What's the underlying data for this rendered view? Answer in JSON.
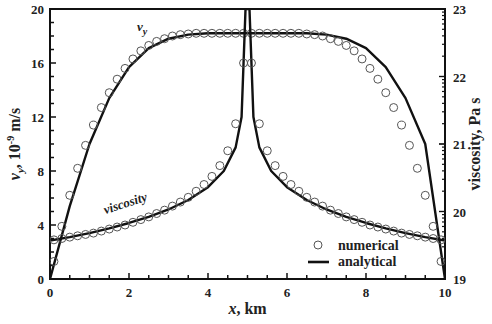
{
  "chart_data": {
    "type": "line",
    "title": "",
    "xlabel": "x, km",
    "ylabel_left": "v_y, 10^-9 m/s",
    "ylabel_right": "viscosity, Pa s",
    "xlim": [
      0,
      10
    ],
    "ylim_left": [
      0,
      20
    ],
    "ylim_right": [
      19,
      23
    ],
    "right_axis_scale": "log10 (exponent labels)",
    "x_ticks": [
      "0",
      "2",
      "4",
      "6",
      "8",
      "10"
    ],
    "y_left_ticks": [
      "0",
      "4",
      "8",
      "12",
      "16",
      "20"
    ],
    "y_right_ticks": [
      "19",
      "20",
      "21",
      "22",
      "23"
    ],
    "grid": false,
    "legend": {
      "position": "lower right",
      "entries": [
        {
          "label": "numerical",
          "marker": "open-circle"
        },
        {
          "label": "analytical",
          "marker": "solid-line"
        }
      ]
    },
    "annotations": [
      {
        "text": "v_y",
        "x": 2.2,
        "y": 18.4
      },
      {
        "text": "viscosity",
        "x": 1.4,
        "y": 4.8
      }
    ],
    "series": [
      {
        "name": "v_y (analytical)",
        "axis": "left",
        "style": "line",
        "x": [
          0,
          0.5,
          1,
          1.5,
          2,
          2.5,
          3,
          3.5,
          4,
          4.5,
          5,
          5.5,
          6,
          6.5,
          7,
          7.5,
          8,
          8.5,
          9,
          9.5,
          10
        ],
        "values": [
          0,
          5.4,
          10.0,
          13.4,
          15.7,
          17.1,
          17.8,
          18.1,
          18.2,
          18.2,
          18.2,
          18.2,
          18.2,
          18.2,
          18.1,
          17.8,
          17.1,
          15.7,
          13.4,
          10.0,
          0
        ]
      },
      {
        "name": "v_y (numerical)",
        "axis": "left",
        "style": "circles",
        "x": [
          0.1,
          0.3,
          0.5,
          0.7,
          0.9,
          1.1,
          1.3,
          1.5,
          1.7,
          1.9,
          2.1,
          2.3,
          2.5,
          2.7,
          2.9,
          3.1,
          3.3,
          3.5,
          3.7,
          3.9,
          4.1,
          4.3,
          4.5,
          4.7,
          4.9,
          5.1,
          5.3,
          5.5,
          5.7,
          5.9,
          6.1,
          6.3,
          6.5,
          6.7,
          6.9,
          7.1,
          7.3,
          7.5,
          7.7,
          7.9,
          8.1,
          8.3,
          8.5,
          8.7,
          8.9,
          9.1,
          9.3,
          9.5,
          9.7,
          9.9
        ],
        "values": [
          1.3,
          3.9,
          6.2,
          8.2,
          9.9,
          11.4,
          12.7,
          13.8,
          14.8,
          15.6,
          16.3,
          16.9,
          17.3,
          17.6,
          17.8,
          18.0,
          18.1,
          18.15,
          18.2,
          18.2,
          18.2,
          18.2,
          18.2,
          18.2,
          18.2,
          18.2,
          18.2,
          18.2,
          18.2,
          18.2,
          18.2,
          18.2,
          18.15,
          18.1,
          18.0,
          17.8,
          17.6,
          17.3,
          16.9,
          16.3,
          15.6,
          14.8,
          13.8,
          12.7,
          11.4,
          9.9,
          8.2,
          6.2,
          3.9,
          1.3
        ]
      },
      {
        "name": "viscosity (analytical)",
        "axis": "right",
        "style": "line",
        "x": [
          0,
          0.5,
          1,
          1.5,
          2,
          2.5,
          3,
          3.5,
          4,
          4.4,
          4.7,
          4.85,
          4.95,
          5.05,
          5.15,
          5.3,
          5.6,
          6,
          6.5,
          7,
          7.5,
          8,
          8.5,
          9,
          9.5,
          10
        ],
        "values": [
          19.57,
          19.62,
          19.68,
          19.75,
          19.83,
          19.92,
          20.03,
          20.17,
          20.36,
          20.6,
          20.95,
          21.4,
          23.0,
          23.0,
          21.4,
          20.95,
          20.6,
          20.36,
          20.17,
          20.03,
          19.92,
          19.83,
          19.75,
          19.68,
          19.62,
          19.57
        ]
      },
      {
        "name": "viscosity (numerical)",
        "axis": "right",
        "style": "circles",
        "x": [
          0.1,
          0.3,
          0.5,
          0.7,
          0.9,
          1.1,
          1.3,
          1.5,
          1.7,
          1.9,
          2.1,
          2.3,
          2.5,
          2.7,
          2.9,
          3.1,
          3.3,
          3.5,
          3.7,
          3.9,
          4.1,
          4.3,
          4.5,
          4.7,
          4.9,
          5.1,
          5.3,
          5.5,
          5.7,
          5.9,
          6.1,
          6.3,
          6.5,
          6.7,
          6.9,
          7.1,
          7.3,
          7.5,
          7.7,
          7.9,
          8.1,
          8.3,
          8.5,
          8.7,
          8.9,
          9.1,
          9.3,
          9.5,
          9.7,
          9.9
        ],
        "values": [
          19.58,
          19.6,
          19.62,
          19.64,
          19.66,
          19.68,
          19.71,
          19.74,
          19.77,
          19.8,
          19.84,
          19.88,
          19.92,
          19.97,
          20.02,
          20.08,
          20.14,
          20.21,
          20.3,
          20.4,
          20.52,
          20.68,
          20.9,
          21.3,
          22.2,
          22.2,
          21.3,
          20.9,
          20.68,
          20.52,
          20.4,
          20.3,
          20.21,
          20.14,
          20.08,
          20.02,
          19.97,
          19.92,
          19.88,
          19.84,
          19.8,
          19.77,
          19.74,
          19.71,
          19.68,
          19.66,
          19.64,
          19.62,
          19.6,
          19.58
        ]
      }
    ]
  }
}
